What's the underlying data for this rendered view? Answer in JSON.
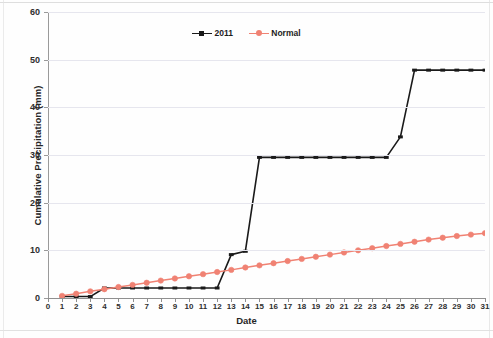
{
  "chart_data": {
    "type": "line",
    "title": "",
    "xlabel": "Date",
    "ylabel": "Cumulative Precipitation (mm)",
    "xlim": [
      0,
      31
    ],
    "ylim": [
      0,
      60
    ],
    "ytick_values": [
      0,
      10,
      20,
      30,
      40,
      50,
      60
    ],
    "ytick_labels": [
      "0",
      "10",
      "20",
      "30",
      "40",
      "50",
      "60"
    ],
    "xtick_values": [
      0,
      1,
      2,
      3,
      4,
      5,
      6,
      7,
      8,
      9,
      10,
      11,
      12,
      13,
      14,
      15,
      16,
      17,
      18,
      19,
      20,
      21,
      22,
      23,
      24,
      25,
      26,
      27,
      28,
      29,
      30,
      31
    ],
    "xtick_labels": [
      "0",
      "1",
      "2",
      "3",
      "4",
      "5",
      "6",
      "7",
      "8",
      "9",
      "10",
      "11",
      "12",
      "13",
      "14",
      "15",
      "16",
      "17",
      "18",
      "19",
      "20",
      "21",
      "22",
      "23",
      "24",
      "25",
      "26",
      "27",
      "28",
      "29",
      "30",
      "31"
    ],
    "grid": true,
    "grid_axis": "y",
    "legend_position": "top-center",
    "x": [
      1,
      2,
      3,
      4,
      5,
      6,
      7,
      8,
      9,
      10,
      11,
      12,
      13,
      14,
      15,
      16,
      17,
      18,
      19,
      20,
      21,
      22,
      23,
      24,
      25,
      26,
      27,
      28,
      29,
      30,
      31
    ],
    "series": [
      {
        "name": "2011",
        "color": "#1a1a1a",
        "marker": "dash",
        "values": [
          0.3,
          0.3,
          0.3,
          2.1,
          2.1,
          2.1,
          2.1,
          2.1,
          2.1,
          2.1,
          2.1,
          2.1,
          9.1,
          9.8,
          29.5,
          29.5,
          29.5,
          29.5,
          29.5,
          29.5,
          29.5,
          29.5,
          29.5,
          29.5,
          33.8,
          47.8,
          47.8,
          47.8,
          47.8,
          47.8,
          47.8
        ]
      },
      {
        "name": "Normal",
        "color": "#f08273",
        "marker": "circle",
        "values": [
          0.45,
          0.9,
          1.4,
          1.85,
          2.3,
          2.75,
          3.2,
          3.65,
          4.1,
          4.55,
          5.0,
          5.45,
          5.9,
          6.4,
          6.85,
          7.3,
          7.75,
          8.2,
          8.65,
          9.1,
          9.55,
          10.0,
          10.45,
          10.9,
          11.35,
          11.8,
          12.25,
          12.65,
          13.0,
          13.3,
          13.6
        ]
      }
    ]
  },
  "legend": {
    "entries": [
      {
        "label": "2011"
      },
      {
        "label": "Normal"
      }
    ]
  },
  "axes": {
    "x_title": "Date",
    "y_title": "Cumulative Precipitation (mm)"
  },
  "colors": {
    "series_2011": "#1a1a1a",
    "series_normal": "#f08273",
    "gridline": "#e6e6ee",
    "axis": "#8f8f8f",
    "background": "#fefefe"
  }
}
